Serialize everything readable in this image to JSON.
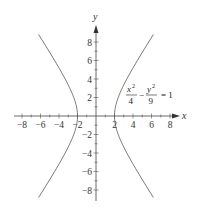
{
  "chart_data": {
    "type": "line",
    "title": "",
    "xlabel": "x",
    "ylabel": "y",
    "xlim": [
      -9,
      9
    ],
    "ylim": [
      -9.5,
      9.5
    ],
    "grid": false,
    "x_ticks": [
      -8,
      -6,
      -4,
      -2,
      2,
      4,
      6,
      8
    ],
    "y_ticks": [
      -8,
      -6,
      -4,
      -2,
      2,
      4,
      6,
      8
    ],
    "x_tick_labels": [
      "−8",
      "−6",
      "−4",
      "−2",
      "2",
      "4",
      "6",
      "8"
    ],
    "y_tick_labels": [
      "8",
      "6",
      "4",
      "2",
      "−2",
      "−4",
      "−6",
      "−8"
    ],
    "annotation": {
      "equation": "x^2/4 - y^2/9 = 1",
      "num1": "x",
      "den1": "4",
      "num2": "y",
      "den2": "9",
      "exp": "2",
      "minus": "−",
      "rhs": "= 1"
    },
    "series": [
      {
        "name": "right branch",
        "a": 2,
        "b": 3,
        "x_range": [
          2,
          6.2
        ]
      },
      {
        "name": "left branch",
        "a": 2,
        "b": 3,
        "x_range": [
          -6.2,
          -2
        ]
      }
    ]
  }
}
